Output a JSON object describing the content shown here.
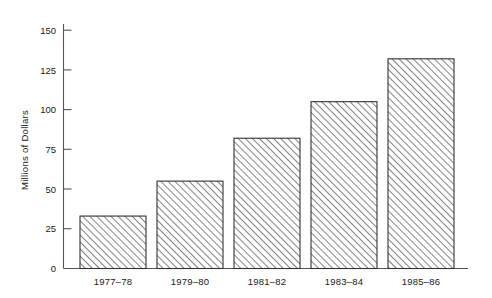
{
  "chart_data": {
    "type": "bar",
    "title": "",
    "subtitle": "",
    "xlabel": "",
    "ylabel": "Millions of Dollars",
    "categories": [
      "1977–78",
      "1979–80",
      "1981–82",
      "1983–84",
      "1985–86"
    ],
    "values": [
      33,
      55,
      82,
      105,
      132
    ],
    "series": [
      {
        "name": "Millions of Dollars",
        "values": [
          33,
          55,
          82,
          105,
          132
        ]
      }
    ],
    "ylim": [
      0,
      150
    ],
    "xlim": [
      0,
      5
    ],
    "yticks": [
      0,
      25,
      50,
      75,
      100,
      125,
      150
    ],
    "ytick_labels": [
      "0",
      "25",
      "50",
      "75",
      "100",
      "125",
      "150"
    ],
    "xtick_labels": [
      "1977–78",
      "1979–80",
      "1981–82",
      "1983–84",
      "1985–86"
    ],
    "grid": false,
    "legend": false,
    "legend_position": "none",
    "annotations": [],
    "bar_fill": "diagonal-hatch",
    "bar_fill_color": "#ffffff",
    "bar_hatch_color": "#6b6b6b",
    "bar_edge_color": "#333333",
    "axis_color": "#555555",
    "text_color": "#1a1a1a",
    "background_color": "#ffffff"
  },
  "axes": {
    "y_axis_title": "Millions of Dollars",
    "y_tick_texts": [
      "150",
      "125",
      "100",
      "75",
      "50",
      "25",
      "0"
    ],
    "x_tick_texts": [
      "1977–78",
      "1979–80",
      "1981–82",
      "1983–84",
      "1985–86"
    ]
  }
}
